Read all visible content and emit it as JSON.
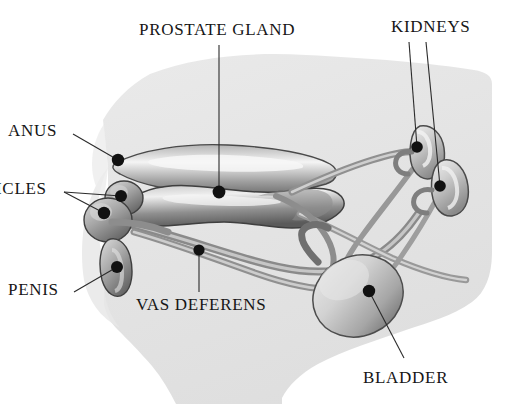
{
  "diagram": {
    "style": "grayscale airbrush medical illustration on white background",
    "canvas": {
      "width": 532,
      "height": 420
    },
    "colors": {
      "background": "#ffffff",
      "body_silhouette": "#e3e3e3",
      "body_silhouette_dark": "#d2d2d2",
      "organ_mid": "#9a9a9a",
      "organ_dark": "#5d5d5d",
      "organ_light": "#d8d8d8",
      "outline": "#3a3a3a",
      "leader_line": "#2b2b2b",
      "leader_dot": "#111111",
      "label_text": "#161616"
    },
    "labels": [
      {
        "id": "anus",
        "text": "ANUS",
        "text_x": 8,
        "text_y": 122,
        "dot_x": 118,
        "dot_y": 160,
        "leader_from_x": 73,
        "leader_from_y": 134
      },
      {
        "id": "testicles",
        "text": "ICLES",
        "text_x": -4,
        "text_y": 180,
        "dot_x": 104,
        "dot_y": 213,
        "dot2_x": 121,
        "dot2_y": 196,
        "leader_from_x": 64,
        "leader_from_y": 192
      },
      {
        "id": "penis",
        "text": "PENIS",
        "text_x": 8,
        "text_y": 281,
        "dot_x": 117,
        "dot_y": 267,
        "leader_from_x": 74,
        "leader_from_y": 292
      },
      {
        "id": "prostate_gland",
        "text": "PROSTATE GLAND",
        "text_x": 139,
        "text_y": 21,
        "dot_x": 219,
        "dot_y": 192,
        "leader_from_x": 219,
        "leader_from_y": 45
      },
      {
        "id": "kidneys",
        "text": "KIDNEYS",
        "text_x": 391,
        "text_y": 18,
        "dot_x": 417,
        "dot_y": 147,
        "dot2_x": 440,
        "dot2_y": 186,
        "leader_from_x": 409,
        "leader_from_y": 42,
        "leader2_from_x": 424,
        "leader2_from_y": 42
      },
      {
        "id": "vas_deferens",
        "text": "VAS DEFERENS",
        "text_x": 136,
        "text_y": 296,
        "dot_x": 199,
        "dot_y": 250,
        "leader_from_x": 199,
        "leader_from_y": 292
      },
      {
        "id": "bladder",
        "text": "BLADDER",
        "text_x": 363,
        "text_y": 369,
        "dot_x": 369,
        "dot_y": 291,
        "leader_from_x": 404,
        "leader_from_y": 358
      }
    ]
  }
}
